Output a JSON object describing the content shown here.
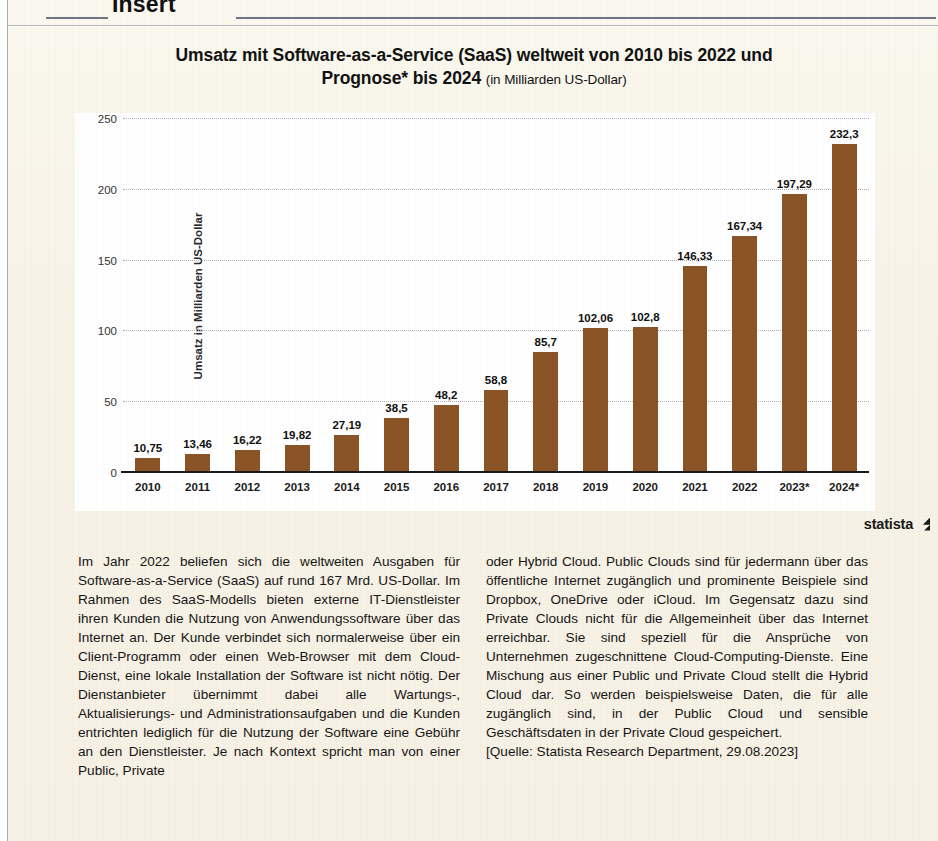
{
  "page_header": {
    "word": "Insert"
  },
  "chart": {
    "title_line1": "Umsatz mit Software-as-a-Service (SaaS) weltweit von 2010 bis 2022 und",
    "title_line2": "Prognose* bis 2024",
    "title_unit": "(in Milliarden US-Dollar)",
    "source_label": "statista",
    "bar_color": "#8a5426",
    "plot_background": "#ffffff"
  },
  "chart_data": {
    "type": "bar",
    "title": "Umsatz mit Software-as-a-Service (SaaS) weltweit von 2010 bis 2022 und Prognose* bis 2024 (in Milliarden US-Dollar)",
    "xlabel": "",
    "ylabel": "Umsatz in Milliarden US-Dollar",
    "ylim": [
      0,
      250
    ],
    "yticks": [
      "0",
      "50",
      "100",
      "150",
      "200",
      "250"
    ],
    "ytick_values": [
      0,
      50,
      100,
      150,
      200,
      250
    ],
    "grid": true,
    "legend": false,
    "categories": [
      "2010",
      "2011",
      "2012",
      "2013",
      "2014",
      "2015",
      "2016",
      "2017",
      "2018",
      "2019",
      "2020",
      "2021",
      "2022",
      "2023*",
      "2024*"
    ],
    "values": [
      10.75,
      13.46,
      16.22,
      19.82,
      27.19,
      38.5,
      48.2,
      58.8,
      85.7,
      102.06,
      102.8,
      146.33,
      167.34,
      197.29,
      232.3
    ],
    "value_labels": [
      "10,75",
      "13,46",
      "16,22",
      "19,82",
      "27,19",
      "38,5",
      "48,2",
      "58,8",
      "85,7",
      "102,06",
      "102,8",
      "146,33",
      "167,34",
      "197,29",
      "232,3"
    ]
  },
  "article": {
    "left_column": "Im Jahr 2022 beliefen sich die weltweiten Ausgaben für Software-as-a-Service (SaaS) auf rund 167 Mrd. US-Dollar. Im Rahmen des SaaS-Modells bieten externe IT-Dienstleister ihren Kunden die Nutzung von Anwendungssoftware über das Internet an. Der Kunde verbindet sich normalerweise über ein Client-Programm oder einen Web-Browser mit dem Cloud-Dienst, eine lokale Installation der Software ist nicht nötig. Der Dienstanbieter übernimmt dabei alle Wartungs-, Aktualisierungs- und Administrationsaufgaben und die Kunden entrichten lediglich für die Nutzung der Software eine Gebühr an den Dienstleister. Je nach Kontext spricht man von einer Public, Private",
    "right_column": "oder Hybrid Cloud. Public Clouds sind für jedermann über das öffentliche Internet zugänglich und prominente Beispiele sind Dropbox, OneDrive oder iCloud. Im Gegensatz dazu sind Private Clouds nicht für die Allgemeinheit über das Internet erreichbar. Sie sind speziell für die Ansprüche von Unternehmen zugeschnittene Cloud-Computing-Dienste. Eine Mischung aus einer Public und Private Cloud stellt die Hybrid Cloud dar. So werden beispielsweise Daten, die für alle zugänglich sind, in der Public Cloud und sensible Geschäftsdaten in der Private Cloud gespeichert.",
    "source": "[Quelle: Statista Research Department, 29.08.2023]"
  }
}
